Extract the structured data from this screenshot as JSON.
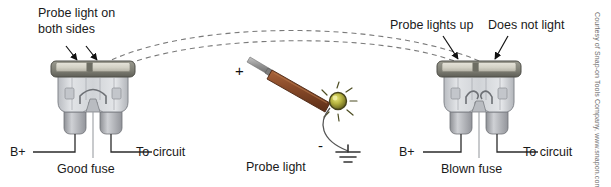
{
  "diagram": {
    "background_color": "#ffffff",
    "width": 611,
    "height": 187
  },
  "labels": {
    "top_left": "Probe light on\nboth sides",
    "top_left_line1": "Probe light on",
    "top_left_line2": "both sides",
    "top_right_a": "Probe lights up",
    "top_right_b": "Does not light",
    "left_bplus": "B+",
    "left_to_circuit": "To circuit",
    "left_fuse_caption": "Good fuse",
    "right_bplus": "B+",
    "right_to_circuit": "To circuit",
    "right_fuse_caption": "Blown fuse",
    "probe_caption": "Probe light",
    "plus_sign": "+",
    "minus_sign": "-"
  },
  "credit": {
    "text": "Courtesy of Snap-on Tools Company, www.snapon.com"
  },
  "colors": {
    "text": "#1a1a1a",
    "credit_text": "#6b6b6b",
    "fuse_cap_contact": "#cfcdc2",
    "fuse_cap_band": "#8f8f85",
    "fuse_cap_dark": "#6e6e66",
    "fuse_body": "#d4d6da",
    "fuse_body_edge": "#8d9095",
    "fuse_leg": "#a7a9ad",
    "probe_handle": "#8a4b2a",
    "probe_handle_dark": "#5d3019",
    "probe_shaft": "#9a9a9a",
    "bulb_glow": "#c9c84a",
    "bulb_core": "#6f6b1e",
    "wire": "#555555",
    "dashed_arc": "#7a7a7a",
    "arrow": "#111111"
  },
  "elements": {
    "left_fuse_state": "good",
    "right_fuse_state": "blown",
    "left_fuse_filament": "intact-arched",
    "right_fuse_filament": "broken-gap",
    "arc_count": 2,
    "probe_bulb_state": "lit",
    "ground_symbol_bars": 3
  }
}
